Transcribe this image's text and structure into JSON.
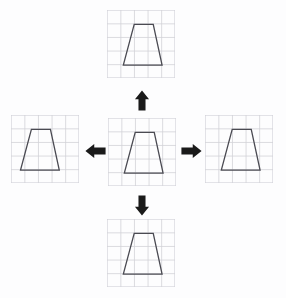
{
  "figure": {
    "background_color": "#fdfdfe",
    "grid": {
      "line_color": "#d2d2d8",
      "cell_size": 13.6,
      "cols": 5,
      "rows": 5,
      "width": 68,
      "height": 68
    },
    "shape": {
      "name": "trapezoid",
      "type": "isosceles-trapezoid",
      "stroke_color": "#4a4a52",
      "stroke_width": 1.3,
      "fill": "none",
      "points_cells": [
        [
          1.55,
          1.0
        ],
        [
          2.95,
          1.0
        ],
        [
          3.6,
          4.0
        ],
        [
          0.75,
          4.0
        ]
      ]
    },
    "arrow_color": "#1a1a1a"
  },
  "panels": [
    {
      "id": "top",
      "name": "top-grid-panel",
      "label": "Top grid with trapezoid",
      "x": 107,
      "y": 10,
      "shape_offset_cells": [
        0.45,
        0.05
      ]
    },
    {
      "id": "left",
      "name": "left-grid-panel",
      "label": "Left grid with trapezoid",
      "x": 11,
      "y": 115,
      "shape_offset_cells": [
        -0.05,
        0.05
      ]
    },
    {
      "id": "center",
      "name": "center-grid-panel",
      "label": "Center grid with trapezoid",
      "x": 108,
      "y": 118,
      "shape_offset_cells": [
        0.45,
        0.05
      ]
    },
    {
      "id": "right",
      "name": "right-grid-panel",
      "label": "Right grid with trapezoid",
      "x": 205,
      "y": 115,
      "shape_offset_cells": [
        0.45,
        0.05
      ]
    },
    {
      "id": "bottom",
      "name": "bottom-grid-panel",
      "label": "Bottom grid with trapezoid",
      "x": 107,
      "y": 219,
      "shape_offset_cells": [
        0.45,
        0.05
      ]
    }
  ],
  "arrows": [
    {
      "id": "up",
      "name": "arrow-up-icon",
      "direction": "up",
      "label": "Arrow pointing up",
      "x": 134,
      "y": 90,
      "w": 16,
      "h": 21
    },
    {
      "id": "left",
      "name": "arrow-left-icon",
      "direction": "left",
      "label": "Arrow pointing left",
      "x": 85,
      "y": 143,
      "w": 21,
      "h": 16
    },
    {
      "id": "right",
      "name": "arrow-right-icon",
      "direction": "right",
      "label": "Arrow pointing right",
      "x": 181,
      "y": 143,
      "w": 21,
      "h": 16
    },
    {
      "id": "down",
      "name": "arrow-down-icon",
      "direction": "down",
      "label": "Arrow pointing down",
      "x": 134,
      "y": 195,
      "w": 16,
      "h": 21
    }
  ]
}
